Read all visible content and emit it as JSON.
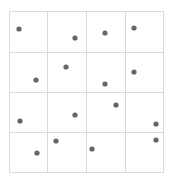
{
  "grid": {
    "rows": 4,
    "cols": 4,
    "x_lines": [
      9,
      47,
      86,
      125,
      163
    ],
    "y_lines": [
      11,
      52,
      92,
      132,
      172
    ],
    "line_color": "#d9d9d9"
  },
  "dot_color": "#666666",
  "dot_radius": 2.6,
  "points": [
    {
      "x": 19,
      "y": 29
    },
    {
      "x": 75,
      "y": 38
    },
    {
      "x": 105,
      "y": 33
    },
    {
      "x": 134,
      "y": 28
    },
    {
      "x": 36,
      "y": 80
    },
    {
      "x": 66,
      "y": 67
    },
    {
      "x": 105,
      "y": 84
    },
    {
      "x": 134,
      "y": 72
    },
    {
      "x": 20,
      "y": 121
    },
    {
      "x": 75,
      "y": 115
    },
    {
      "x": 116,
      "y": 105
    },
    {
      "x": 156,
      "y": 124
    },
    {
      "x": 37,
      "y": 153
    },
    {
      "x": 56,
      "y": 141
    },
    {
      "x": 92,
      "y": 149
    },
    {
      "x": 156,
      "y": 140
    }
  ]
}
